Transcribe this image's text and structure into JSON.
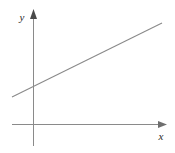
{
  "figure": {
    "background_color": "#ffffff",
    "width": 175,
    "height": 153,
    "line_color": "#8a8a8a",
    "axis_color": "#8a8a8a",
    "label_color": "#2b2b2b"
  },
  "axes": {
    "x_axis": {
      "label": "x",
      "label_x": 161,
      "label_y": 140,
      "start_x": 12,
      "end_x": 167,
      "y": 124,
      "arrow": "arrow-right"
    },
    "y_axis": {
      "label": "y",
      "label_x": 22,
      "label_y": 21,
      "x": 33,
      "start_y": 146,
      "end_y": 9,
      "arrow": "arrow-up"
    },
    "origin": {
      "x": 33,
      "y": 124
    }
  },
  "chart_data": {
    "type": "line",
    "title": "",
    "subtitle": "",
    "xlabel": "x",
    "ylabel": "y",
    "grid": false,
    "legend": "none",
    "annotations": [],
    "axis_style": "arrowed-cartesian-axes",
    "xlim": [
      -0.62,
      6.72
    ],
    "ylim": [
      -0.97,
      5.09
    ],
    "series": [
      {
        "name": "linear function",
        "description": "straight line with positive slope crossing the positive y-axis",
        "color": "#8a8a8a",
        "slope": 0.49,
        "y_intercept": 1.64,
        "x_intercept": -3.33,
        "x": [
          -0.93,
          5.73
        ],
        "y": [
          1.18,
          4.48
        ],
        "pixel_points": [
          {
            "x": 12,
            "y": 97
          },
          {
            "x": 162,
            "y": 23
          }
        ]
      }
    ]
  }
}
